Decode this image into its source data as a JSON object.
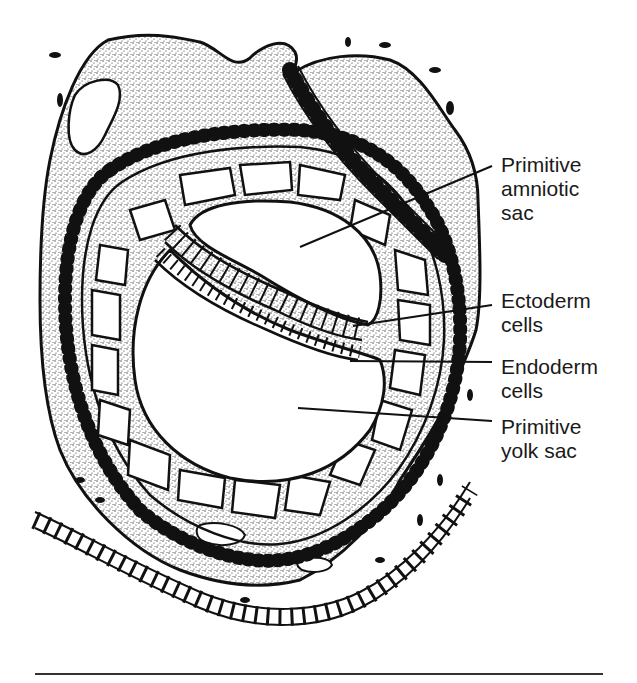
{
  "diagram": {
    "colors": {
      "ink": "#111111",
      "label_text": "#1a1a1a",
      "background": "#ffffff",
      "stipple": "#333333"
    },
    "labels": [
      {
        "id": "amniotic",
        "lines": [
          "Primitive",
          "amniotic",
          "sac"
        ],
        "top": 153,
        "leader": {
          "x1": 300,
          "y1": 247,
          "x2": 492,
          "y2": 166
        }
      },
      {
        "id": "ectoderm",
        "lines": [
          "Ectoderm",
          "cells"
        ],
        "top": 289,
        "leader": {
          "x1": 353,
          "y1": 326,
          "x2": 492,
          "y2": 305
        }
      },
      {
        "id": "endoderm",
        "lines": [
          "Endoderm",
          "cells"
        ],
        "top": 355,
        "leader": {
          "x1": 350,
          "y1": 361,
          "x2": 492,
          "y2": 362
        }
      },
      {
        "id": "yolk",
        "lines": [
          "Primitive",
          "yolk sac"
        ],
        "top": 415,
        "leader": {
          "x1": 298,
          "y1": 408,
          "x2": 492,
          "y2": 421
        }
      }
    ]
  }
}
